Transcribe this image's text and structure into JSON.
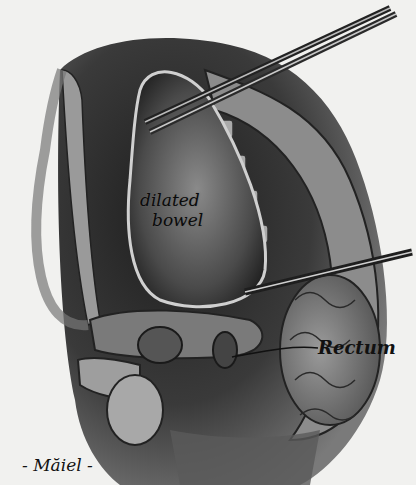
{
  "illustration": {
    "subject": "sagittal section of pelvis with dilated bowel and rectum, surgical instruments",
    "labels": {
      "dilated_line1": "dilated",
      "dilated_line2": "bowel",
      "rectum": "Rectum"
    },
    "signature": "- Măiel -",
    "colors": {
      "background": "#f1f1ef",
      "tissue_dark": "#2a2a2a",
      "tissue_mid": "#6e6e6e",
      "tissue_light": "#bdbdbd",
      "instrument": "#3a3a3a"
    }
  }
}
